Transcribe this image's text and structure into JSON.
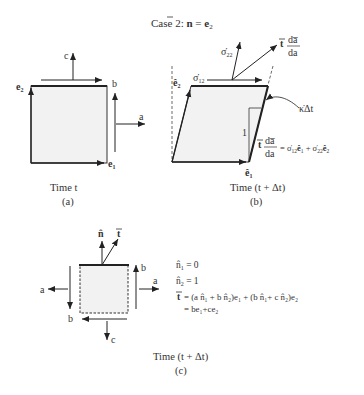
{
  "title": {
    "prefix": "Case 2: ",
    "n": "n",
    "eq": " = ",
    "e": "e",
    "sub": "2"
  },
  "panel_a": {
    "time_label": "Time t",
    "caption": "(a)",
    "labels": {
      "c": "c",
      "b": "b",
      "a": "a",
      "e2": "e",
      "e2_sub": "2",
      "e1": "e",
      "e1_sub": "1"
    },
    "fill_color": "#f2f2f2"
  },
  "panel_b": {
    "time_label": "Time (t + Δt)",
    "caption": "(b)",
    "labels": {
      "sigma22": "σ̇",
      "sigma22_sub": "22",
      "sigma12": "σ̇",
      "sigma12_sub": "12",
      "t_vec": "t",
      "frac_num": "da̅",
      "frac_den": "da",
      "e2hat": "ê",
      "e2hat_sub": "2",
      "e1hat": "ê",
      "e1hat_sub": "1",
      "kappa": "κ̇Δt",
      "one": "1",
      "eq_rhs_a": "= σ̇",
      "eq_rhs_a_sub": "12",
      "eq_rhs_b": "ê",
      "eq_rhs_b_sub": "1",
      "eq_rhs_c": " + σ̇",
      "eq_rhs_c_sub": "22",
      "eq_rhs_d": "ê",
      "eq_rhs_d_sub": "2"
    }
  },
  "panel_c": {
    "time_label": "Time (t + Δt)",
    "caption": "(c)",
    "labels": {
      "n": "n̂",
      "t": "t",
      "a_left": "a",
      "a_right": "a",
      "b_left": "b",
      "b_right": "b",
      "c": "c"
    },
    "equations": [
      {
        "text": "n̂",
        "sub": "1",
        "rest": " = 0"
      },
      {
        "text": "n̂",
        "sub": "2",
        "rest": " = 1"
      }
    ],
    "eq_t_line1": "= (a n̂₁ + b n̂₂)e₁ + (b n̂₁+ c n̂₂)e₂",
    "eq_t_line2": "= be₁+ce₂",
    "eq_t_symbol": "t"
  }
}
